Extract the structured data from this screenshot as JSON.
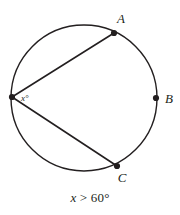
{
  "figure": {
    "type": "circle-geometry-diagram",
    "background_color": "#ffffff",
    "stroke_color": "#231f20",
    "circle": {
      "center_x": 84,
      "center_y": 98,
      "radius": 73,
      "stroke_width": 1.4
    },
    "points": [
      {
        "id": "vertex",
        "label": "",
        "cx": 12,
        "cy": 97,
        "dot": true
      },
      {
        "id": "A",
        "label": "A",
        "cx": 114,
        "cy": 33,
        "label_x": 121,
        "label_y": 23,
        "dot": true
      },
      {
        "id": "B",
        "label": "B",
        "cx": 156,
        "cy": 98,
        "label_x": 165,
        "label_y": 103,
        "dot": true
      },
      {
        "id": "C",
        "label": "C",
        "cx": 117,
        "cy": 166,
        "label_x": 122,
        "label_y": 182,
        "dot": true
      }
    ],
    "chords": [
      {
        "id": "chord-vertex-A",
        "x1": 12,
        "y1": 97,
        "x2": 114,
        "y2": 33
      },
      {
        "id": "chord-vertex-C",
        "x1": 12,
        "y1": 97,
        "x2": 117,
        "y2": 166
      }
    ],
    "angle": {
      "id": "inscribed-angle",
      "label": "x°",
      "label_x": 21,
      "label_y": 101,
      "at_point": "vertex"
    }
  },
  "caption": {
    "variable": "x",
    "relation": " > 60°",
    "full": "x > 60°"
  }
}
